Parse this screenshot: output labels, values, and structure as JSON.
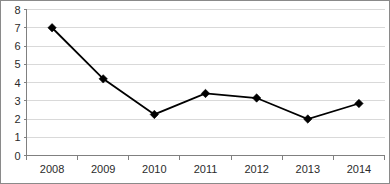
{
  "chart_data": {
    "type": "line",
    "title": "",
    "xlabel": "",
    "ylabel": "",
    "categories": [
      "2008",
      "2009",
      "2010",
      "2011",
      "2012",
      "2013",
      "2014"
    ],
    "values": [
      7.0,
      4.2,
      2.25,
      3.4,
      3.15,
      2.0,
      2.85
    ],
    "series": [
      {
        "name": "",
        "values": [
          7.0,
          4.2,
          2.25,
          3.4,
          3.15,
          2.0,
          2.85
        ]
      }
    ],
    "ylim": [
      0,
      8
    ],
    "ytick_labels": [
      "0",
      "1",
      "2",
      "3",
      "4",
      "5",
      "6",
      "7",
      "8"
    ],
    "ytick_values": [
      0,
      1,
      2,
      3,
      4,
      5,
      6,
      7,
      8
    ],
    "grid": true,
    "grid_axis": "y",
    "legend": false,
    "legend_position": "none",
    "marker": "diamond",
    "colors": {
      "series_line": "#000000",
      "marker": "#000000",
      "gridline": "#d9d9d9",
      "axis": "#808080",
      "background": "#ffffff",
      "border": "#8a8a8a",
      "tick_text": "#2b2b2b"
    }
  }
}
